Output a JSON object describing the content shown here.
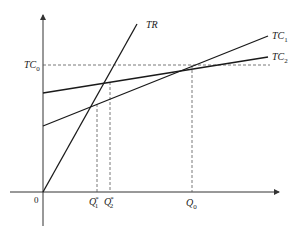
{
  "diagram": {
    "type": "economics-cost-revenue-breakeven",
    "origin_label": "0",
    "curves": [
      {
        "id": "TR",
        "label": "TR",
        "description": "total revenue line from origin"
      },
      {
        "id": "TC1",
        "label": "TC",
        "subscript": "1",
        "description": "total cost line 1, lower intercept, steeper"
      },
      {
        "id": "TC2",
        "label": "TC",
        "subscript": "2",
        "description": "total cost line 2, higher intercept, flatter"
      }
    ],
    "y_level": {
      "label": "TC",
      "subscript": "0"
    },
    "x_markers": [
      {
        "label": "Q",
        "subscript": "1",
        "superscript": "*"
      },
      {
        "label": "Q",
        "subscript": "2",
        "superscript": "*"
      },
      {
        "label": "Q",
        "subscript": "0"
      }
    ],
    "colors": {
      "line": "#1a1a1a",
      "dashed": "#555555",
      "background": "#ffffff"
    }
  }
}
